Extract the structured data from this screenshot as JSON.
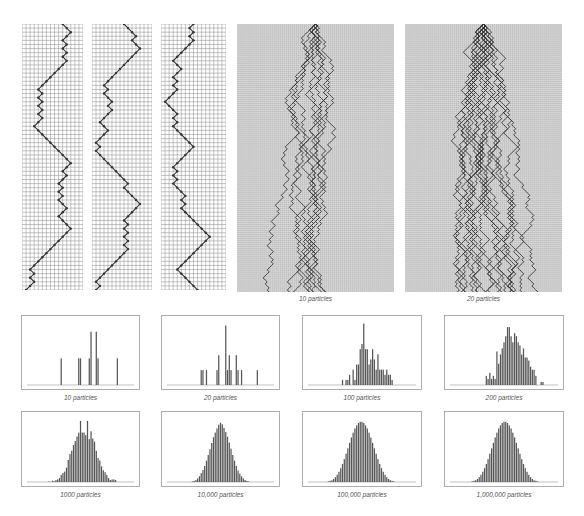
{
  "figure": {
    "background": "#ffffff",
    "grid_color": "#8a8a8a",
    "dense_grid_bg": "#b8b8b8",
    "path_color": "#333333",
    "bar_color": "#555555",
    "box_color": "#9a9a9a"
  },
  "walks": [
    {
      "id": "walk-1",
      "x": 22,
      "y": 24,
      "w": 61,
      "h": 266,
      "cols": 15,
      "rows": 65,
      "caption": "",
      "paths": [
        [
          10,
          11,
          12,
          11,
          10,
          11,
          10,
          11,
          10,
          11,
          10,
          9,
          8,
          7,
          6,
          5,
          4,
          5,
          4,
          5,
          4,
          5,
          4,
          5,
          4,
          3,
          4,
          5,
          6,
          7,
          8,
          9,
          10,
          11,
          12,
          11,
          10,
          11,
          10,
          9,
          10,
          9,
          10,
          9,
          10,
          11,
          10,
          9,
          10,
          11,
          12,
          11,
          10,
          9,
          8,
          7,
          6,
          5,
          4,
          3,
          2,
          3,
          2,
          3,
          2,
          1
        ]
      ]
    },
    {
      "id": "walk-2",
      "x": 92,
      "y": 24,
      "w": 60,
      "h": 266,
      "cols": 15,
      "rows": 65,
      "caption": "",
      "paths": [
        [
          8,
          9,
          10,
          11,
          10,
          11,
          12,
          11,
          10,
          9,
          8,
          7,
          6,
          5,
          4,
          3,
          4,
          3,
          4,
          5,
          4,
          5,
          4,
          3,
          2,
          3,
          4,
          3,
          2,
          1,
          2,
          1,
          2,
          3,
          4,
          5,
          6,
          7,
          8,
          9,
          8,
          9,
          10,
          11,
          12,
          11,
          10,
          9,
          8,
          9,
          8,
          9,
          8,
          9,
          8,
          9,
          8,
          7,
          6,
          5,
          4,
          3,
          2,
          1,
          2,
          1
        ]
      ]
    },
    {
      "id": "walk-3",
      "x": 161,
      "y": 24,
      "w": 65,
      "h": 266,
      "cols": 16,
      "rows": 65,
      "caption": "",
      "paths": [
        [
          8,
          7,
          8,
          7,
          8,
          7,
          6,
          5,
          4,
          3,
          4,
          5,
          4,
          3,
          4,
          3,
          4,
          3,
          2,
          1,
          2,
          3,
          4,
          3,
          4,
          3,
          4,
          5,
          6,
          7,
          8,
          7,
          6,
          5,
          4,
          3,
          4,
          3,
          4,
          3,
          4,
          5,
          6,
          5,
          6,
          5,
          6,
          7,
          8,
          9,
          10,
          11,
          12,
          11,
          10,
          9,
          8,
          7,
          6,
          5,
          4,
          5,
          6,
          7,
          8,
          9,
          8
        ]
      ]
    },
    {
      "id": "walk-10",
      "x": 237,
      "y": 24,
      "w": 157,
      "h": 268,
      "cols": 78,
      "rows": 133,
      "caption": "10 particles",
      "caption_y": 295,
      "particles": 10,
      "seed": 7
    },
    {
      "id": "walk-20",
      "x": 405,
      "y": 24,
      "w": 157,
      "h": 268,
      "cols": 78,
      "rows": 133,
      "caption": "20 particles",
      "caption_y": 295,
      "particles": 20,
      "seed": 11
    }
  ],
  "chart_data": [
    {
      "type": "bar",
      "title": "10 particles",
      "box": [
        21,
        315,
        119,
        75
      ],
      "caption_y": 394,
      "bins": 61,
      "values": [
        0,
        0,
        0,
        0,
        0,
        0,
        0,
        0,
        0,
        0,
        0,
        0,
        0,
        0,
        0,
        0,
        0,
        0,
        0,
        1,
        0,
        0,
        0,
        0,
        0,
        0,
        0,
        0,
        0,
        1,
        1,
        0,
        0,
        0,
        0,
        1,
        2,
        0,
        0,
        2,
        1,
        0,
        0,
        0,
        0,
        0,
        0,
        0,
        0,
        0,
        0,
        1,
        0,
        0,
        0,
        0,
        0,
        0,
        0,
        0,
        0
      ],
      "ymax": 2.4
    },
    {
      "type": "bar",
      "title": "20 particles",
      "box": [
        161,
        315,
        119,
        75
      ],
      "caption_y": 394,
      "bins": 61,
      "values": [
        0,
        0,
        0,
        0,
        0,
        0,
        0,
        0,
        0,
        0,
        0,
        0,
        0,
        0,
        0,
        0,
        0,
        0,
        0,
        1,
        1,
        0,
        1,
        0,
        0,
        0,
        0,
        0,
        1,
        2,
        0,
        0,
        0,
        4,
        1,
        2,
        1,
        0,
        0,
        2,
        1,
        0,
        1,
        0,
        0,
        0,
        0,
        0,
        0,
        0,
        0,
        1,
        0,
        0,
        0,
        0,
        0,
        0,
        0,
        0,
        0
      ],
      "ymax": 4.3
    },
    {
      "type": "bar",
      "title": "100 particles",
      "box": [
        302,
        315,
        120,
        75
      ],
      "caption_y": 394,
      "bins": 61,
      "values": [
        0,
        0,
        0,
        0,
        0,
        0,
        0,
        0,
        0,
        0,
        0,
        0,
        0,
        0,
        0,
        0,
        0,
        0,
        0,
        1,
        0,
        1,
        1,
        2,
        0,
        3,
        1,
        4,
        4,
        7,
        8,
        12,
        7,
        7,
        4,
        5,
        7,
        5,
        3,
        6,
        3,
        3,
        3,
        2,
        3,
        2,
        2,
        1,
        0,
        0,
        0,
        0,
        0,
        0,
        0,
        0,
        0,
        0,
        0,
        0,
        0
      ],
      "ymax": 12.5
    },
    {
      "type": "bar",
      "title": "200 particles",
      "box": [
        444,
        315,
        120,
        75
      ],
      "caption_y": 394,
      "bins": 61,
      "values": [
        0,
        0,
        0,
        0,
        0,
        0,
        0,
        0,
        0,
        0,
        0,
        0,
        0,
        0,
        0,
        0,
        0,
        0,
        0,
        0,
        3,
        2,
        4,
        2,
        3,
        2,
        11,
        7,
        10,
        12,
        14,
        16,
        19,
        19,
        16,
        14,
        17,
        16,
        14,
        13,
        10,
        12,
        9,
        9,
        8,
        6,
        5,
        5,
        3,
        0,
        0,
        1,
        1,
        0,
        0,
        0,
        0,
        0,
        0,
        0,
        0
      ],
      "ymax": 21
    },
    {
      "type": "bar",
      "title": "1000 particles",
      "box": [
        21,
        411,
        119,
        76
      ],
      "caption_y": 491,
      "bins": 61,
      "values": [
        0,
        0,
        0,
        0,
        0,
        0,
        0,
        0,
        0,
        0,
        0,
        0,
        1,
        0,
        2,
        1,
        3,
        4,
        6,
        11,
        14,
        16,
        22,
        34,
        43,
        48,
        57,
        63,
        70,
        76,
        94,
        76,
        76,
        72,
        94,
        66,
        78,
        67,
        62,
        48,
        37,
        33,
        24,
        18,
        15,
        11,
        6,
        3,
        4,
        4,
        3,
        0,
        0,
        0,
        0,
        0,
        0,
        0,
        0,
        0,
        0
      ],
      "ymax": 100
    },
    {
      "type": "bar",
      "title": "10,000 particles",
      "box": [
        161,
        411,
        119,
        76
      ],
      "caption_y": 491,
      "bins": 61,
      "values": [
        0,
        0,
        0,
        0,
        0,
        0,
        0,
        0,
        0,
        0,
        0,
        0,
        0,
        0,
        1,
        2,
        4,
        7,
        11,
        17,
        23,
        31,
        41,
        52,
        63,
        75,
        86,
        95,
        103,
        110,
        114,
        111,
        104,
        96,
        87,
        76,
        64,
        52,
        41,
        31,
        22,
        16,
        11,
        7,
        4,
        2,
        1,
        0,
        0,
        0,
        0,
        0,
        0,
        0,
        0,
        0,
        0,
        0,
        0,
        0,
        0
      ],
      "ymax": 125
    },
    {
      "type": "bar",
      "title": "100,000 particles",
      "box": [
        302,
        411,
        120,
        76
      ],
      "caption_y": 491,
      "bins": 61,
      "values": [
        0,
        0,
        0,
        0,
        0,
        0,
        0,
        0,
        0,
        0,
        0,
        1,
        2,
        3,
        5,
        8,
        12,
        17,
        23,
        30,
        38,
        47,
        56,
        65,
        74,
        82,
        89,
        94,
        98,
        100,
        100,
        98,
        94,
        89,
        82,
        74,
        65,
        56,
        47,
        38,
        30,
        23,
        17,
        12,
        8,
        5,
        3,
        2,
        1,
        0,
        0,
        0,
        0,
        0,
        0,
        0,
        0,
        0,
        0,
        0,
        0
      ],
      "ymax": 108
    },
    {
      "type": "bar",
      "title": "1,000,000 particles",
      "box": [
        444,
        411,
        120,
        76
      ],
      "caption_y": 491,
      "bins": 61,
      "values": [
        0,
        0,
        0,
        0,
        0,
        0,
        0,
        0,
        0,
        0,
        0,
        0,
        1,
        2,
        3,
        5,
        8,
        12,
        17,
        23,
        30,
        38,
        47,
        56,
        65,
        74,
        82,
        89,
        94,
        98,
        100,
        100,
        98,
        94,
        89,
        82,
        74,
        65,
        56,
        47,
        38,
        30,
        23,
        17,
        12,
        8,
        5,
        3,
        2,
        1,
        0,
        0,
        0,
        0,
        0,
        0,
        0,
        0,
        0,
        0,
        0
      ],
      "ymax": 108
    }
  ]
}
